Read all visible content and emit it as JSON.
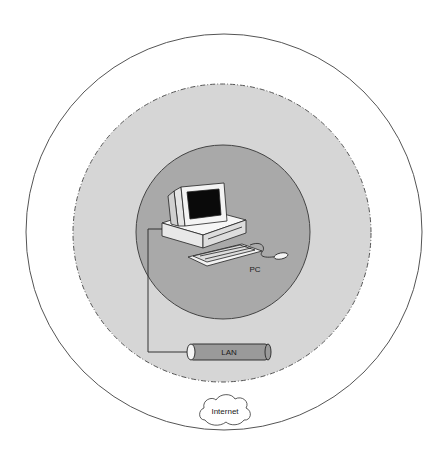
{
  "diagram": {
    "type": "concentric network scope diagram",
    "colors": {
      "background": "#ffffff",
      "outer_ring_stroke": "#555555",
      "middle_zone_fill": "#d6d6d6",
      "middle_zone_stroke": "#555555",
      "inner_zone_fill": "#a9a9a9",
      "inner_zone_stroke": "#444444",
      "lan_cable_fill": "#9a9a9a",
      "monitor_screen": "#0a0a0a",
      "device_body": "#f2f2f2"
    },
    "zones": [
      {
        "name": "outer",
        "style": "solid outline"
      },
      {
        "name": "middle",
        "style": "dash-dot outline, light gray fill"
      },
      {
        "name": "inner",
        "style": "solid outline, darker gray fill"
      }
    ],
    "nodes": {
      "pc": {
        "label": "PC",
        "icon": "desktop-computer-icon"
      },
      "lan": {
        "label": "LAN",
        "icon": "cable-cylinder-icon"
      },
      "internet": {
        "label": "Internet",
        "icon": "cloud-icon"
      }
    },
    "connections": [
      {
        "from": "PC",
        "to": "LAN"
      }
    ]
  }
}
